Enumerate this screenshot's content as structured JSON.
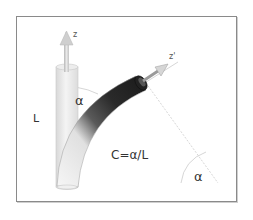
{
  "diagram": {
    "labels": {
      "z_axis": "z",
      "z_prime_axis": "z'",
      "length": "L",
      "angle_top": "α",
      "angle_bottom": "α",
      "equation": "C=α/L"
    },
    "elements": {
      "straight_cylinder": "Straight reference cylinder of length L along z axis",
      "bent_tube": "Curved tube bent by angle α, shaded dark at tip",
      "z_arrow": "Vertical z axis arrow",
      "z_prime_arrow": "Tilted z' axis arrow at tip of bent tube",
      "arc_center_lines": "Dotted radius lines meeting at bend center with angle α"
    },
    "colors": {
      "frame": "#8a8a8a",
      "tube_dark": "#1a1a1a",
      "tube_light": "#f2f2f2",
      "cylinder": "#e6e6e6",
      "arrow": "#c8c8c8",
      "guide_line": "#bdbdbd"
    }
  }
}
